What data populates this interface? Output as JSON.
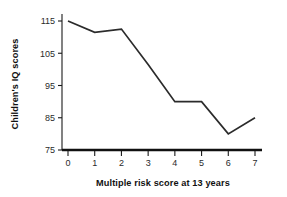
{
  "chart_data": {
    "type": "line",
    "title": "",
    "subtitle": "",
    "xlabel": "Multiple risk score at 13 years",
    "ylabel": "Children's IQ scores",
    "x": [
      0,
      1,
      2,
      3,
      4,
      5,
      6,
      7
    ],
    "values": [
      115,
      111.5,
      112.5,
      101.5,
      90,
      90,
      80,
      85
    ],
    "series": [
      {
        "name": "Children's IQ scores",
        "values": [
          115,
          111.5,
          112.5,
          101.5,
          90,
          90,
          80,
          85
        ]
      }
    ],
    "xtick_labels": [
      "0",
      "1",
      "2",
      "3",
      "4",
      "5",
      "6",
      "7"
    ],
    "ytick_labels": [
      "75",
      "85",
      "95",
      "105",
      "115"
    ],
    "ytick_values": [
      75,
      85,
      95,
      105,
      115
    ],
    "xlim": [
      -0.4,
      7.4
    ],
    "ylim": [
      75,
      119
    ],
    "grid": false,
    "legend": false,
    "legend_position": "none",
    "line_color": "#2b2b2b",
    "axis_color": "#1a1a1a",
    "background_color": "#ffffff"
  },
  "geometry": {
    "plot_left": 68,
    "plot_right": 255,
    "baseline_y": 150,
    "y_top": 21,
    "y_axis_x": 62
  }
}
